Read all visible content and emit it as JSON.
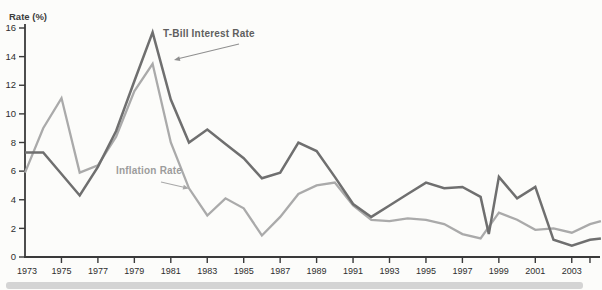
{
  "chart_data": {
    "type": "line",
    "title": "",
    "ylabel": "Rate (%)",
    "xlabel": "",
    "ylim": [
      0,
      16
    ],
    "xlim": [
      1973,
      2004.6
    ],
    "y_ticks": [
      0,
      2,
      4,
      6,
      8,
      10,
      12,
      14,
      16
    ],
    "x_tick_labels": [
      "1973",
      "1975",
      "1977",
      "1979",
      "1981",
      "1983",
      "1985",
      "1987",
      "1989",
      "1991",
      "1993",
      "1995",
      "1997",
      "1999",
      "2001",
      "2003"
    ],
    "x_tick_years": [
      1973,
      1975,
      1977,
      1979,
      1981,
      1983,
      1985,
      1987,
      1989,
      1991,
      1993,
      1995,
      1997,
      1999,
      2001,
      2003
    ],
    "unlabeled_end_tick_year": 2004,
    "grid": false,
    "legend_position": "inline-annotations",
    "axis_color": "#3a3a3a",
    "series": [
      {
        "name": "T-Bill Interest Rate",
        "color": "#6f6f6f",
        "points": [
          [
            1973,
            7.3
          ],
          [
            1974,
            7.3
          ],
          [
            1975,
            5.8
          ],
          [
            1976,
            4.3
          ],
          [
            1977,
            6.3
          ],
          [
            1978,
            8.8
          ],
          [
            1979,
            12.3
          ],
          [
            1980,
            15.7
          ],
          [
            1981,
            11.0
          ],
          [
            1982,
            8.0
          ],
          [
            1983,
            8.9
          ],
          [
            1984,
            7.9
          ],
          [
            1985,
            6.9
          ],
          [
            1986,
            5.5
          ],
          [
            1987,
            5.9
          ],
          [
            1988,
            8.0
          ],
          [
            1989,
            7.4
          ],
          [
            1990,
            5.6
          ],
          [
            1991,
            3.7
          ],
          [
            1992,
            2.8
          ],
          [
            1993,
            3.6
          ],
          [
            1994,
            4.4
          ],
          [
            1995,
            5.2
          ],
          [
            1996,
            4.8
          ],
          [
            1997,
            4.9
          ],
          [
            1998,
            4.2
          ],
          [
            1998.45,
            1.6
          ],
          [
            1999,
            5.6
          ],
          [
            2000,
            4.1
          ],
          [
            2001,
            4.9
          ],
          [
            2002,
            1.2
          ],
          [
            2003,
            0.8
          ],
          [
            2004,
            1.2
          ],
          [
            2004.6,
            1.3
          ]
        ]
      },
      {
        "name": "Inflation Rate",
        "color": "#aaaaaa",
        "points": [
          [
            1973,
            5.9
          ],
          [
            1974,
            9.0
          ],
          [
            1975,
            11.1
          ],
          [
            1976,
            5.9
          ],
          [
            1977,
            6.4
          ],
          [
            1978,
            8.4
          ],
          [
            1979,
            11.6
          ],
          [
            1980,
            13.5
          ],
          [
            1981,
            8.0
          ],
          [
            1982,
            4.8
          ],
          [
            1983,
            2.9
          ],
          [
            1984,
            4.1
          ],
          [
            1985,
            3.4
          ],
          [
            1986,
            1.5
          ],
          [
            1987,
            2.8
          ],
          [
            1988,
            4.4
          ],
          [
            1989,
            5.0
          ],
          [
            1990,
            5.2
          ],
          [
            1991,
            3.6
          ],
          [
            1992,
            2.6
          ],
          [
            1993,
            2.5
          ],
          [
            1994,
            2.7
          ],
          [
            1995,
            2.6
          ],
          [
            1996,
            2.3
          ],
          [
            1997,
            1.6
          ],
          [
            1998,
            1.3
          ],
          [
            1999,
            3.1
          ],
          [
            2000,
            2.6
          ],
          [
            2001,
            1.9
          ],
          [
            2002,
            2.0
          ],
          [
            2003,
            1.7
          ],
          [
            2004,
            2.3
          ],
          [
            2004.6,
            2.5
          ]
        ]
      }
    ]
  }
}
